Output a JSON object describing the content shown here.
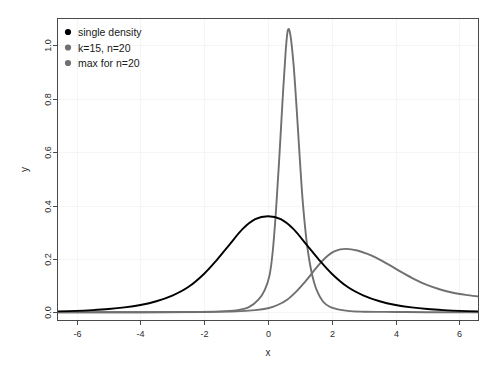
{
  "chart_data": {
    "type": "line",
    "title": "",
    "xlabel": "x",
    "ylabel": "y",
    "xlim": [
      -6.6,
      6.6
    ],
    "ylim": [
      -0.03,
      1.1
    ],
    "xticks": [
      -6,
      -4,
      -2,
      0,
      2,
      4,
      6
    ],
    "xticklabels": [
      "-6",
      "-4",
      "-2",
      "0",
      "2",
      "4",
      "6"
    ],
    "yticks": [
      0.0,
      0.2,
      0.4,
      0.6,
      0.8,
      1.0
    ],
    "yticklabels": [
      "0.0",
      "0.2",
      "0.4",
      "0.6",
      "0.8",
      "1.0"
    ],
    "grid": true,
    "legend_position": "upper left",
    "series": [
      {
        "name": "single density",
        "color": "#000000",
        "marker": "dot",
        "peak_x": 0.0,
        "peak_y": 0.36,
        "x": [
          -6.6,
          -6.0,
          -5.5,
          -5.0,
          -4.5,
          -4.0,
          -3.5,
          -3.0,
          -2.5,
          -2.0,
          -1.6,
          -1.2,
          -0.8,
          -0.4,
          0.0,
          0.4,
          0.8,
          1.2,
          1.6,
          2.0,
          2.5,
          3.0,
          3.5,
          4.0,
          4.5,
          5.0,
          5.5,
          6.0,
          6.6
        ],
        "y": [
          0.004,
          0.006,
          0.009,
          0.013,
          0.019,
          0.028,
          0.042,
          0.063,
          0.095,
          0.145,
          0.197,
          0.255,
          0.312,
          0.349,
          0.36,
          0.349,
          0.312,
          0.255,
          0.197,
          0.145,
          0.095,
          0.063,
          0.042,
          0.028,
          0.019,
          0.013,
          0.009,
          0.006,
          0.004
        ]
      },
      {
        "name": "k=15, n=20",
        "color": "#707070",
        "marker": "dot",
        "peak_x": 0.62,
        "peak_y": 1.055,
        "x": [
          -6.6,
          -4.0,
          -2.5,
          -1.5,
          -1.0,
          -0.6,
          -0.3,
          -0.1,
          0.05,
          0.15,
          0.25,
          0.35,
          0.45,
          0.55,
          0.62,
          0.7,
          0.8,
          0.9,
          1.0,
          1.1,
          1.25,
          1.45,
          1.7,
          2.0,
          2.5,
          3.0,
          4.0,
          5.0,
          6.6
        ],
        "y": [
          0.001,
          0.001,
          0.002,
          0.004,
          0.008,
          0.02,
          0.048,
          0.085,
          0.14,
          0.23,
          0.38,
          0.57,
          0.78,
          0.97,
          1.055,
          1.04,
          0.93,
          0.76,
          0.57,
          0.4,
          0.23,
          0.11,
          0.045,
          0.018,
          0.006,
          0.003,
          0.002,
          0.001,
          0.001
        ]
      },
      {
        "name": "max for n=20",
        "color": "#707070",
        "marker": "dot",
        "peak_x": 2.45,
        "peak_y": 0.238,
        "x": [
          -6.6,
          -4.0,
          -2.0,
          -1.0,
          -0.4,
          0.0,
          0.3,
          0.6,
          0.9,
          1.2,
          1.5,
          1.8,
          2.1,
          2.45,
          2.8,
          3.1,
          3.4,
          3.8,
          4.2,
          4.6,
          5.0,
          5.4,
          5.8,
          6.2,
          6.6
        ],
        "y": [
          0.0005,
          0.001,
          0.002,
          0.004,
          0.009,
          0.016,
          0.028,
          0.048,
          0.08,
          0.12,
          0.165,
          0.205,
          0.23,
          0.238,
          0.232,
          0.22,
          0.204,
          0.178,
          0.15,
          0.124,
          0.102,
          0.086,
          0.074,
          0.066,
          0.06
        ]
      }
    ]
  },
  "legend": {
    "entries": [
      {
        "label": "single density",
        "color": "#000000"
      },
      {
        "label": "k=15, n=20",
        "color": "#707070"
      },
      {
        "label": "max for n=20",
        "color": "#707070"
      }
    ]
  },
  "axes": {
    "x_title": "x",
    "y_title": "y"
  }
}
